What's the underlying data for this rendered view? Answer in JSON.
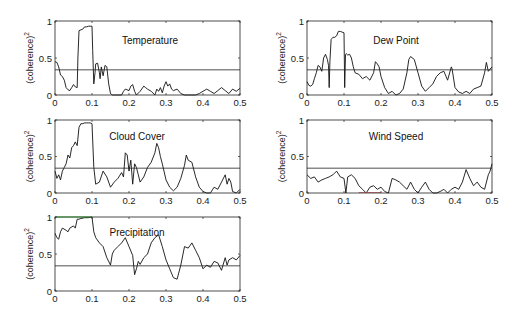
{
  "chart_data": [
    {
      "type": "line",
      "title": "Temperature",
      "xlabel": "",
      "ylabel": "(coherence)^2",
      "xlim": [
        0,
        0.5
      ],
      "ylim": [
        0,
        1
      ],
      "xticks": [
        "0",
        "0.1",
        "0.2",
        "0.3",
        "0.4",
        "0.5"
      ],
      "yticks": [
        "0",
        "0.5",
        "1"
      ],
      "threshold": 0.34,
      "grid": false,
      "series": [
        {
          "name": "Temperature",
          "x": [
            0,
            0.005,
            0.01,
            0.015,
            0.02,
            0.025,
            0.03,
            0.035,
            0.04,
            0.045,
            0.05,
            0.055,
            0.06,
            0.062,
            0.065,
            0.07,
            0.075,
            0.08,
            0.085,
            0.09,
            0.095,
            0.1,
            0.102,
            0.105,
            0.108,
            0.11,
            0.115,
            0.12,
            0.122,
            0.125,
            0.13,
            0.135,
            0.14,
            0.145,
            0.15,
            0.155,
            0.16,
            0.17,
            0.18,
            0.185,
            0.19,
            0.2,
            0.205,
            0.21,
            0.215,
            0.22,
            0.23,
            0.24,
            0.245,
            0.25,
            0.26,
            0.27,
            0.275,
            0.28,
            0.285,
            0.29,
            0.295,
            0.3,
            0.305,
            0.31,
            0.315,
            0.32,
            0.33,
            0.34,
            0.35,
            0.36,
            0.37,
            0.38,
            0.39,
            0.4,
            0.41,
            0.42,
            0.43,
            0.44,
            0.45,
            0.46,
            0.47,
            0.48,
            0.49,
            0.5
          ],
          "values": [
            0.45,
            0.44,
            0.38,
            0.27,
            0.25,
            0.2,
            0.1,
            0.07,
            0.06,
            0.1,
            0.14,
            0.11,
            0.1,
            0.5,
            0.87,
            0.88,
            0.89,
            0.92,
            0.92,
            0.93,
            0.93,
            0.93,
            0.6,
            0.15,
            0.3,
            0.42,
            0.43,
            0.3,
            0.22,
            0.38,
            0.26,
            0.4,
            0.38,
            0.15,
            0.02,
            0.0,
            0.0,
            0.0,
            0.0,
            0.05,
            0.08,
            0.06,
            0.12,
            0.14,
            0.05,
            0.0,
            0.05,
            0.12,
            0.1,
            0.08,
            0.05,
            0.0,
            0.08,
            0.05,
            0.1,
            0.03,
            0.12,
            0.18,
            0.12,
            0.15,
            0.08,
            0.06,
            0.08,
            0.02,
            0.0,
            0.0,
            0.0,
            0.0,
            0.02,
            0.05,
            0.08,
            0.05,
            0.02,
            0.06,
            0.1,
            0.06,
            0.02,
            0.08,
            0.05,
            0.09
          ]
        }
      ]
    },
    {
      "type": "line",
      "title": "Dew Point",
      "xlabel": "",
      "ylabel": "(coherence)^2",
      "xlim": [
        0,
        0.5
      ],
      "ylim": [
        0,
        1
      ],
      "xticks": [
        "0",
        "0.1",
        "0.2",
        "0.3",
        "0.4",
        "0.5"
      ],
      "yticks": [
        "0",
        "0.5",
        "1"
      ],
      "threshold": 0.34,
      "grid": false,
      "series": [
        {
          "name": "Dew Point",
          "x": [
            0,
            0.005,
            0.01,
            0.015,
            0.02,
            0.025,
            0.03,
            0.035,
            0.04,
            0.045,
            0.05,
            0.055,
            0.058,
            0.06,
            0.062,
            0.065,
            0.07,
            0.075,
            0.08,
            0.085,
            0.09,
            0.095,
            0.1,
            0.102,
            0.104,
            0.106,
            0.11,
            0.115,
            0.12,
            0.125,
            0.13,
            0.14,
            0.15,
            0.16,
            0.17,
            0.18,
            0.185,
            0.19,
            0.195,
            0.2,
            0.21,
            0.22,
            0.23,
            0.24,
            0.25,
            0.26,
            0.27,
            0.275,
            0.28,
            0.29,
            0.3,
            0.31,
            0.32,
            0.33,
            0.34,
            0.35,
            0.36,
            0.37,
            0.38,
            0.39,
            0.392,
            0.4,
            0.41,
            0.42,
            0.43,
            0.44,
            0.45,
            0.46,
            0.47,
            0.48,
            0.485,
            0.49,
            0.495,
            0.5
          ],
          "values": [
            0.18,
            0.13,
            0.12,
            0.14,
            0.22,
            0.3,
            0.4,
            0.38,
            0.32,
            0.5,
            0.55,
            0.48,
            0.4,
            0.1,
            0.45,
            0.75,
            0.78,
            0.78,
            0.8,
            0.86,
            0.86,
            0.85,
            0.84,
            0.1,
            0.55,
            0.56,
            0.54,
            0.55,
            0.5,
            0.38,
            0.3,
            0.28,
            0.22,
            0.25,
            0.2,
            0.3,
            0.45,
            0.42,
            0.38,
            0.25,
            0.1,
            0.02,
            0.05,
            0.0,
            0.02,
            0.08,
            0.3,
            0.48,
            0.52,
            0.48,
            0.3,
            0.12,
            0.05,
            0.1,
            0.15,
            0.25,
            0.3,
            0.32,
            0.2,
            0.38,
            0.36,
            0.1,
            0.04,
            0.02,
            0.05,
            0.02,
            0.08,
            0.1,
            0.12,
            0.3,
            0.44,
            0.32,
            0.35,
            0.38
          ]
        }
      ]
    },
    {
      "type": "line",
      "title": "Cloud Cover",
      "xlabel": "",
      "ylabel": "(coherence)^2",
      "xlim": [
        0,
        0.5
      ],
      "ylim": [
        0,
        1
      ],
      "xticks": [
        "0",
        "0.1",
        "0.2",
        "0.3",
        "0.4",
        "0.5"
      ],
      "yticks": [
        "0",
        "0.5",
        "1"
      ],
      "threshold": 0.34,
      "grid": false,
      "series": [
        {
          "name": "Cloud Cover",
          "x": [
            0,
            0.005,
            0.01,
            0.015,
            0.02,
            0.025,
            0.03,
            0.035,
            0.04,
            0.045,
            0.05,
            0.055,
            0.06,
            0.065,
            0.07,
            0.075,
            0.08,
            0.085,
            0.09,
            0.095,
            0.1,
            0.105,
            0.11,
            0.12,
            0.13,
            0.14,
            0.15,
            0.16,
            0.17,
            0.18,
            0.185,
            0.19,
            0.195,
            0.2,
            0.205,
            0.21,
            0.215,
            0.22,
            0.225,
            0.23,
            0.24,
            0.25,
            0.26,
            0.27,
            0.275,
            0.28,
            0.285,
            0.29,
            0.3,
            0.31,
            0.32,
            0.33,
            0.34,
            0.35,
            0.355,
            0.36,
            0.37,
            0.38,
            0.39,
            0.4,
            0.41,
            0.42,
            0.43,
            0.44,
            0.45,
            0.46,
            0.465,
            0.47,
            0.475,
            0.48,
            0.49,
            0.5
          ],
          "values": [
            0.3,
            0.2,
            0.25,
            0.18,
            0.3,
            0.35,
            0.4,
            0.52,
            0.48,
            0.62,
            0.65,
            0.7,
            0.65,
            0.9,
            0.95,
            0.95,
            0.96,
            0.96,
            0.96,
            0.96,
            0.95,
            0.35,
            0.12,
            0.15,
            0.3,
            0.22,
            0.08,
            0.15,
            0.2,
            0.28,
            0.22,
            0.55,
            0.52,
            0.3,
            0.45,
            0.12,
            0.4,
            0.35,
            0.25,
            0.15,
            0.22,
            0.35,
            0.42,
            0.55,
            0.68,
            0.62,
            0.5,
            0.4,
            0.18,
            0.08,
            0.03,
            0.08,
            0.2,
            0.38,
            0.52,
            0.45,
            0.42,
            0.22,
            0.08,
            0.02,
            0.0,
            0.0,
            0.08,
            0.05,
            0.15,
            0.25,
            0.12,
            0.2,
            0.15,
            0.02,
            0.0,
            0.05
          ]
        }
      ]
    },
    {
      "type": "line",
      "title": "Wind Speed",
      "xlabel": "",
      "ylabel": "(coherence)^2",
      "xlim": [
        0,
        0.5
      ],
      "ylim": [
        0,
        1
      ],
      "xticks": [
        "0",
        "0.1",
        "0.2",
        "0.3",
        "0.4",
        "0.5"
      ],
      "yticks": [
        "0",
        "0.5",
        "1"
      ],
      "threshold": 0.34,
      "grid": false,
      "series": [
        {
          "name": "Wind Speed",
          "x": [
            0,
            0.01,
            0.02,
            0.03,
            0.04,
            0.05,
            0.06,
            0.07,
            0.08,
            0.09,
            0.1,
            0.105,
            0.11,
            0.12,
            0.13,
            0.14,
            0.15,
            0.16,
            0.17,
            0.18,
            0.19,
            0.2,
            0.21,
            0.22,
            0.23,
            0.24,
            0.25,
            0.26,
            0.27,
            0.28,
            0.29,
            0.3,
            0.31,
            0.32,
            0.33,
            0.34,
            0.35,
            0.36,
            0.37,
            0.38,
            0.39,
            0.4,
            0.41,
            0.42,
            0.43,
            0.44,
            0.45,
            0.46,
            0.47,
            0.48,
            0.49,
            0.495,
            0.5
          ],
          "values": [
            0.25,
            0.2,
            0.22,
            0.15,
            0.18,
            0.2,
            0.22,
            0.25,
            0.3,
            0.22,
            0.2,
            0.0,
            0.22,
            0.25,
            0.2,
            0.1,
            0.05,
            0.0,
            0.08,
            0.1,
            0.05,
            0.08,
            0.02,
            0.0,
            0.2,
            0.18,
            0.15,
            0.1,
            0.05,
            0.15,
            0.05,
            0.0,
            0.08,
            0.15,
            0.05,
            0.0,
            0.0,
            0.02,
            0.05,
            0.0,
            0.05,
            0.08,
            0.05,
            0.15,
            0.32,
            0.2,
            0.1,
            0.15,
            0.08,
            0.05,
            0.25,
            0.3,
            0.4
          ]
        }
      ]
    },
    {
      "type": "line",
      "title": "Precipitation",
      "xlabel": "",
      "ylabel": "(coherence)^2",
      "xlim": [
        0,
        0.5
      ],
      "ylim": [
        0,
        1
      ],
      "xticks": [
        "0",
        "0.1",
        "0.2",
        "0.3",
        "0.4",
        "0.5"
      ],
      "yticks": [
        "0",
        "0.5",
        "1"
      ],
      "threshold": 0.34,
      "grid": false,
      "series": [
        {
          "name": "Precipitation",
          "x": [
            0,
            0.005,
            0.01,
            0.015,
            0.02,
            0.03,
            0.035,
            0.04,
            0.05,
            0.055,
            0.06,
            0.065,
            0.07,
            0.08,
            0.09,
            0.1,
            0.105,
            0.11,
            0.12,
            0.13,
            0.14,
            0.15,
            0.155,
            0.16,
            0.17,
            0.18,
            0.19,
            0.2,
            0.21,
            0.215,
            0.22,
            0.225,
            0.23,
            0.24,
            0.25,
            0.26,
            0.27,
            0.28,
            0.29,
            0.3,
            0.31,
            0.32,
            0.33,
            0.34,
            0.35,
            0.36,
            0.37,
            0.38,
            0.39,
            0.4,
            0.41,
            0.42,
            0.43,
            0.44,
            0.45,
            0.46,
            0.465,
            0.47,
            0.48,
            0.49,
            0.5
          ],
          "values": [
            0.78,
            0.72,
            0.7,
            0.8,
            0.85,
            0.82,
            0.8,
            0.85,
            0.88,
            0.85,
            0.97,
            0.97,
            0.98,
            0.99,
            0.99,
            1.0,
            0.8,
            0.72,
            0.65,
            0.6,
            0.45,
            0.35,
            0.5,
            0.55,
            0.6,
            0.65,
            0.72,
            0.6,
            0.48,
            0.22,
            0.3,
            0.4,
            0.36,
            0.45,
            0.5,
            0.65,
            0.72,
            0.76,
            0.6,
            0.42,
            0.3,
            0.18,
            0.16,
            0.35,
            0.6,
            0.58,
            0.65,
            0.55,
            0.45,
            0.3,
            0.35,
            0.32,
            0.4,
            0.38,
            0.28,
            0.45,
            0.35,
            0.42,
            0.45,
            0.42,
            0.48
          ]
        }
      ]
    }
  ],
  "panels": [
    {
      "title": "Temperature",
      "ylabel": "(coherence)",
      "ylabel_sup": "2"
    },
    {
      "title": "Dew Point",
      "ylabel": "(coherence)",
      "ylabel_sup": "2"
    },
    {
      "title": "Cloud Cover",
      "ylabel": "(coherence)",
      "ylabel_sup": "2"
    },
    {
      "title": "Wind Speed",
      "ylabel": "(coherence)",
      "ylabel_sup": "2"
    },
    {
      "title": "Precipitation",
      "ylabel": "(coherence)",
      "ylabel_sup": "2"
    }
  ],
  "accents": {
    "curve": "#111111",
    "frame": "#222222",
    "precip_top": "#33cc33",
    "wind_base": "#e06060"
  }
}
